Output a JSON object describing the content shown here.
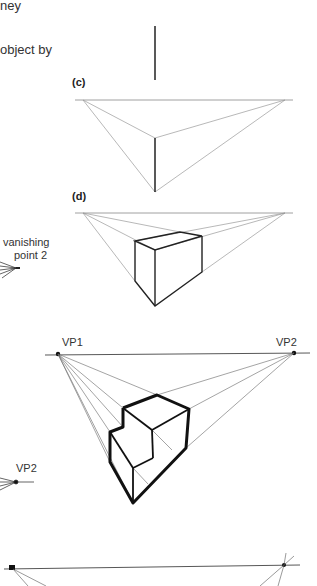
{
  "text_fragments": [
    "ney",
    "object by"
  ],
  "panels": [
    {
      "label": "(c)"
    },
    {
      "label": "(d)"
    }
  ],
  "annotations": {
    "vanishing_point_2": [
      "vanishing",
      "point 2"
    ],
    "vp1": "VP1",
    "vp2_top": "VP2",
    "vp2_left": "VP2"
  },
  "colors": {
    "ink": "#111111",
    "guide": "#888888"
  }
}
